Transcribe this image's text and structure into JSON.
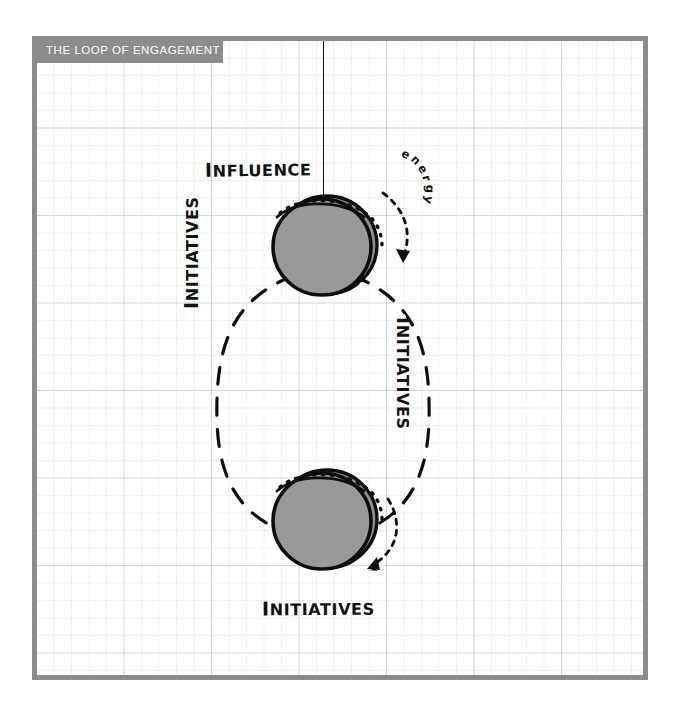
{
  "canvas": {
    "width": 675,
    "height": 714,
    "background": "#ffffff",
    "frame_color": "#8c8c8c",
    "grid_color": "#969ea8"
  },
  "header": {
    "title": "THE LOOP OF ENGAGEMENT",
    "band_color": "#8c8c8c",
    "text_color": "#ffffff"
  },
  "diagram": {
    "type": "hand-drawn-cycle",
    "ink_color": "#111111",
    "node_fill": "#909090",
    "nodes": [
      {
        "id": "influence",
        "label": "INFLUENCE",
        "label_cap": "I",
        "label_rest": "NFLUENCE",
        "cx": 318,
        "cy": 238,
        "r": 51
      },
      {
        "id": "initiatives",
        "label": "INITIATIVES",
        "label_cap": "I",
        "label_rest": "NITIATIVES",
        "cx": 318,
        "cy": 512,
        "r": 51
      }
    ],
    "edges": [
      {
        "id": "stem",
        "label": "",
        "style": "solid",
        "from": "top-frame",
        "to": "influence"
      },
      {
        "id": "left-arc",
        "label": "INITIATIVES",
        "label_cap": "I",
        "label_rest": "NITIATIVES",
        "style": "dashed",
        "from": "influence",
        "to": "initiatives"
      },
      {
        "id": "right-arc",
        "label": "INITIATIVES",
        "label_cap": "I",
        "label_rest": "NITIATIVES",
        "style": "dashed",
        "from": "initiatives",
        "to": "influence"
      }
    ],
    "annotations": [
      {
        "id": "energy",
        "label": "energy",
        "letters": [
          "e",
          "n",
          "e",
          "r",
          "g",
          "y"
        ],
        "style": "dotted-arrow"
      },
      {
        "id": "initiatives-spin",
        "label": "",
        "style": "dotted-arrow"
      }
    ]
  }
}
